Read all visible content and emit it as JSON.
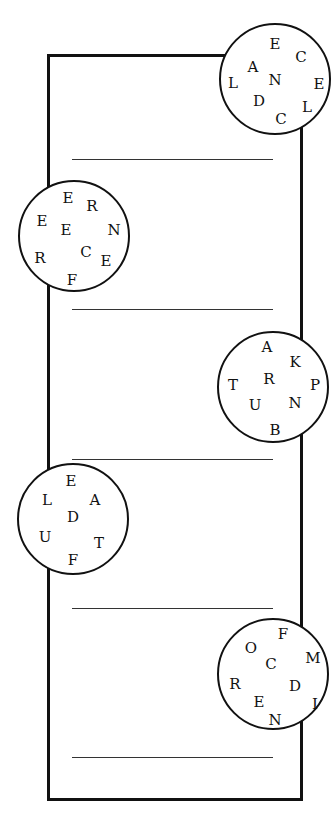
{
  "puzzle": {
    "frame": {
      "left": 47,
      "top": 54,
      "right": 300,
      "bottom": 798
    },
    "answer_lines_y": [
      159,
      309,
      459,
      608,
      757
    ],
    "circles": [
      {
        "side": "right",
        "cx": 275,
        "cy": 79,
        "letters": [
          {
            "ch": "E",
            "x": 52,
            "y": 17
          },
          {
            "ch": "C",
            "x": 78,
            "y": 30
          },
          {
            "ch": "A",
            "x": 30,
            "y": 40
          },
          {
            "ch": "L",
            "x": 10,
            "y": 56
          },
          {
            "ch": "N",
            "x": 52,
            "y": 53
          },
          {
            "ch": "E",
            "x": 96,
            "y": 57
          },
          {
            "ch": "D",
            "x": 36,
            "y": 74
          },
          {
            "ch": "L",
            "x": 84,
            "y": 80
          },
          {
            "ch": "C",
            "x": 58,
            "y": 92
          }
        ]
      },
      {
        "side": "left",
        "cx": 74,
        "cy": 236,
        "letters": [
          {
            "ch": "E",
            "x": 46,
            "y": 14
          },
          {
            "ch": "R",
            "x": 70,
            "y": 22
          },
          {
            "ch": "E",
            "x": 20,
            "y": 37
          },
          {
            "ch": "E",
            "x": 44,
            "y": 46
          },
          {
            "ch": "N",
            "x": 92,
            "y": 46
          },
          {
            "ch": "R",
            "x": 18,
            "y": 74
          },
          {
            "ch": "C",
            "x": 64,
            "y": 68
          },
          {
            "ch": "E",
            "x": 84,
            "y": 77
          },
          {
            "ch": "F",
            "x": 50,
            "y": 96
          }
        ]
      },
      {
        "side": "right",
        "cx": 273,
        "cy": 387,
        "letters": [
          {
            "ch": "A",
            "x": 46,
            "y": 12
          },
          {
            "ch": "K",
            "x": 74,
            "y": 27
          },
          {
            "ch": "T",
            "x": 12,
            "y": 50
          },
          {
            "ch": "R",
            "x": 48,
            "y": 44
          },
          {
            "ch": "P",
            "x": 94,
            "y": 50
          },
          {
            "ch": "U",
            "x": 34,
            "y": 70
          },
          {
            "ch": "N",
            "x": 74,
            "y": 68
          },
          {
            "ch": "B",
            "x": 54,
            "y": 95
          }
        ]
      },
      {
        "side": "left",
        "cx": 73,
        "cy": 519,
        "letters": [
          {
            "ch": "E",
            "x": 50,
            "y": 14
          },
          {
            "ch": "L",
            "x": 26,
            "y": 33
          },
          {
            "ch": "A",
            "x": 74,
            "y": 33
          },
          {
            "ch": "D",
            "x": 52,
            "y": 50
          },
          {
            "ch": "U",
            "x": 24,
            "y": 70
          },
          {
            "ch": "T",
            "x": 78,
            "y": 76
          },
          {
            "ch": "F",
            "x": 52,
            "y": 93
          }
        ]
      },
      {
        "side": "right",
        "cx": 273,
        "cy": 674,
        "letters": [
          {
            "ch": "F",
            "x": 62,
            "y": 12
          },
          {
            "ch": "O",
            "x": 30,
            "y": 26
          },
          {
            "ch": "M",
            "x": 92,
            "y": 36
          },
          {
            "ch": "C",
            "x": 50,
            "y": 42
          },
          {
            "ch": "R",
            "x": 14,
            "y": 62
          },
          {
            "ch": "D",
            "x": 74,
            "y": 64
          },
          {
            "ch": "E",
            "x": 38,
            "y": 80
          },
          {
            "ch": "I",
            "x": 94,
            "y": 82
          },
          {
            "ch": "N",
            "x": 54,
            "y": 98
          }
        ]
      }
    ]
  }
}
